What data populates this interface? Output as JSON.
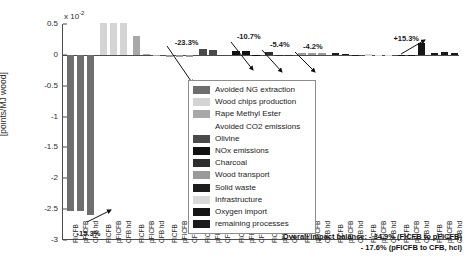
{
  "chart_data": {
    "type": "bar",
    "title": "",
    "xlabel": "",
    "ylabel": "[points/MJ wood]",
    "y_multiplier": "x 10",
    "y_multiplier_exp": "-2",
    "ylim": [
      -3,
      0.5
    ],
    "yticks": [
      "0.5",
      "0",
      "-0.5",
      "-1",
      "-1.5",
      "-2",
      "-2.5",
      "-3"
    ],
    "ytick_values": [
      0.5,
      0,
      -0.5,
      -1,
      -1.5,
      -2,
      -2.5,
      -3
    ],
    "grid": false,
    "legend_position": "inside-center",
    "categories": [
      "FICFB",
      "pFICFB",
      "CFB hd"
    ],
    "series": [
      {
        "name": "Avoided NG extraction",
        "color": "#6e6e6e",
        "values": [
          -2.53,
          -2.53,
          -2.6
        ]
      },
      {
        "name": "Wood chips production",
        "color": "#d4d4d4",
        "values": [
          0.52,
          0.52,
          0.52
        ]
      },
      {
        "name": "Rape Methyl Ester",
        "color": "#a8a8a8",
        "values": [
          0.3,
          0.01,
          0.0
        ]
      },
      {
        "name": "Avoided CO2 emissions",
        "color": "#ffffff",
        "values": [
          0.0,
          0.0,
          0.0
        ]
      },
      {
        "name": "Olivine",
        "color": "#4a4a4a",
        "values": [
          0.09,
          0.08,
          0.0
        ]
      },
      {
        "name": "NOx emissions",
        "color": "#111111",
        "values": [
          0.055,
          0.055,
          0.0
        ]
      },
      {
        "name": "Charcoal",
        "color": "#2e2e2e",
        "values": [
          0.045,
          0.0,
          0.0
        ]
      },
      {
        "name": "Wood transport",
        "color": "#9a9a9a",
        "values": [
          0.028,
          0.028,
          0.028
        ]
      },
      {
        "name": "Solid waste",
        "color": "#1c1c1c",
        "values": [
          0.024,
          0.012,
          0.004
        ]
      },
      {
        "name": "Infrastructure",
        "color": "#d9d9d9",
        "values": [
          0.008,
          0.004,
          0.004
        ]
      },
      {
        "name": "Oxygen import",
        "color": "#151515",
        "values": [
          0.0,
          0.0,
          0.2
        ]
      },
      {
        "name": "remaining processes",
        "color": "#1a1a1a",
        "values": [
          0.022,
          0.05,
          0.03
        ]
      }
    ],
    "annotations": [
      {
        "label": "-15.3%",
        "group": 0
      },
      {
        "label": "-23.3%",
        "group": 2
      },
      {
        "label": "-10.7%",
        "group": 4
      },
      {
        "label": "-5.4%",
        "group": 5
      },
      {
        "label": "-4.2%",
        "group": 6
      },
      {
        "label": "+15.3%",
        "group": 10
      }
    ]
  },
  "legend": {
    "items": [
      {
        "label": "Avoided NG extraction",
        "color": "#6e6e6e"
      },
      {
        "label": "Wood chips production",
        "color": "#d4d4d4"
      },
      {
        "label": "Rape Methyl Ester",
        "color": "#a8a8a8"
      },
      {
        "label": "Avoided CO2 emissions",
        "color": "#ffffff"
      },
      {
        "label": "Olivine",
        "color": "#4a4a4a"
      },
      {
        "label": "NOx emissions",
        "color": "#111111"
      },
      {
        "label": "Charcoal",
        "color": "#2e2e2e"
      },
      {
        "label": "Wood transport",
        "color": "#9a9a9a"
      },
      {
        "label": "Solid waste",
        "color": "#1c1c1c"
      },
      {
        "label": "Infrastructure",
        "color": "#d9d9d9"
      },
      {
        "label": "Oxygen import",
        "color": "#151515"
      },
      {
        "label": "remaining processes",
        "color": "#1a1a1a"
      }
    ]
  },
  "footer": {
    "line1": "Overall impact balance: - 34.9% (FICFB to pFICFB)",
    "line2": "- 17.6% (pFICFB to CFB, hcl)"
  },
  "xtick_labels": [
    "FICFB",
    "pFICFB",
    "CFB hd",
    "FICFB",
    "pFICFB",
    "CFB hd",
    "FICFB",
    "pFICFB",
    "CFB hd",
    "FICFB",
    "pFICFB",
    "CFB hd",
    "FICFB",
    "pFICFB",
    "CFB hd",
    "FICFB",
    "pFICFB",
    "CFB hd",
    "FICFB",
    "pFICFB",
    "CFB hd",
    "FICFB",
    "pFICFB",
    "CFB hd",
    "FICFB",
    "pFICFB",
    "CFB hd",
    "FICFB",
    "pFICFB",
    "CFB hd",
    "FICFB",
    "pFICFB",
    "CFB hd",
    "FICFB",
    "pFICFB",
    "CFB hd"
  ]
}
